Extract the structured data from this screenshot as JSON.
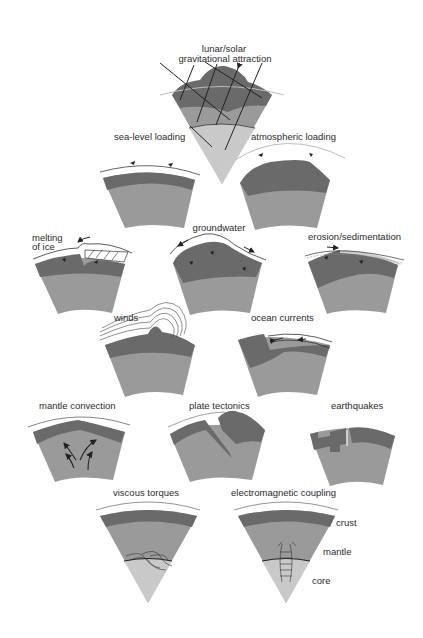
{
  "diagram": {
    "colors": {
      "background": "#ffffff",
      "crust": "#6a6a6a",
      "mantle": "#9a9a9a",
      "core": "#c9c9c9",
      "line": "#222222",
      "ocean_line": "#bbbbbb"
    },
    "panels": [
      {
        "id": "gravitational",
        "label": "lunar/solar gravitational attraction",
        "label_lines": [
          "lunar/solar",
          "gravitational attraction"
        ]
      },
      {
        "id": "sea-level",
        "label": "sea-level loading"
      },
      {
        "id": "atmospheric",
        "label": "atmospheric loading"
      },
      {
        "id": "ice",
        "label": "melting of ice",
        "label_lines": [
          "melting",
          "of ice"
        ]
      },
      {
        "id": "groundwater",
        "label": "groundwater"
      },
      {
        "id": "erosion",
        "label": "erosion/sedimentation"
      },
      {
        "id": "winds",
        "label": "winds"
      },
      {
        "id": "ocean",
        "label": "ocean currents"
      },
      {
        "id": "mantle-convection",
        "label": "mantle convection"
      },
      {
        "id": "plate-tectonics",
        "label": "plate tectonics"
      },
      {
        "id": "earthquakes",
        "label": "earthquakes"
      },
      {
        "id": "viscous",
        "label": "viscous torques"
      },
      {
        "id": "em",
        "label": "electromagnetic coupling"
      }
    ],
    "layer_labels": {
      "crust": "crust",
      "mantle": "mantle",
      "core": "core"
    }
  }
}
